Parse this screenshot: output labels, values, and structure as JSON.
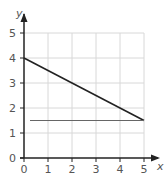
{
  "chart_data": {
    "type": "line",
    "title": "",
    "xlabel": "x",
    "ylabel": "y",
    "xlim": [
      0,
      5
    ],
    "ylim": [
      0,
      5
    ],
    "grid": true,
    "x_ticks": [
      "0",
      "1",
      "2",
      "3",
      "4",
      "5"
    ],
    "y_ticks": [
      "0",
      "1",
      "2",
      "3",
      "4",
      "5"
    ],
    "series": [
      {
        "name": "decreasing line",
        "x": [
          0,
          5
        ],
        "y": [
          4,
          1.5
        ],
        "color": "#222222"
      },
      {
        "name": "horizontal line y=1.5",
        "x": [
          0.25,
          5
        ],
        "y": [
          1.5,
          1.5
        ],
        "color": "#666666"
      }
    ]
  },
  "colors": {
    "axis": "#222222",
    "grid": "#d8d8d8",
    "tick_label": "#555555"
  }
}
